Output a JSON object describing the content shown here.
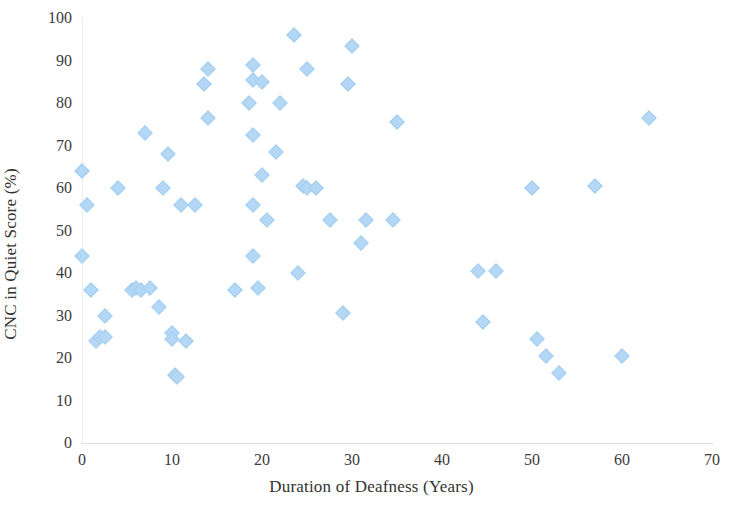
{
  "chart_data": {
    "type": "scatter",
    "title": "",
    "xlabel": "Duration of Deafness (Years)",
    "ylabel": "CNC in Quiet Score (%)",
    "xlim": [
      0,
      70
    ],
    "ylim": [
      0,
      100
    ],
    "xticks": [
      0,
      10,
      20,
      30,
      40,
      50,
      60,
      70
    ],
    "yticks": [
      0,
      10,
      20,
      30,
      40,
      50,
      60,
      70,
      80,
      90,
      100
    ],
    "grid": false,
    "legend": null,
    "marker": "diamond",
    "marker_color": "#b3d7f5",
    "series": [
      {
        "name": "Participants",
        "points": [
          [
            0,
            64
          ],
          [
            0,
            44
          ],
          [
            0.5,
            56
          ],
          [
            1,
            36
          ],
          [
            1.5,
            24
          ],
          [
            2,
            25
          ],
          [
            2.5,
            25
          ],
          [
            2.5,
            30
          ],
          [
            4,
            60
          ],
          [
            5.5,
            36
          ],
          [
            6,
            36.5
          ],
          [
            6.5,
            36
          ],
          [
            7,
            73
          ],
          [
            7.5,
            36.5
          ],
          [
            8.5,
            32
          ],
          [
            9,
            60
          ],
          [
            9.5,
            68
          ],
          [
            10,
            26
          ],
          [
            10,
            24.5
          ],
          [
            10.3,
            16
          ],
          [
            10.5,
            15.5
          ],
          [
            11,
            56
          ],
          [
            11.5,
            24
          ],
          [
            12.5,
            56
          ],
          [
            13.5,
            84.5
          ],
          [
            14,
            88
          ],
          [
            14,
            76.5
          ],
          [
            17,
            36
          ],
          [
            18.5,
            80
          ],
          [
            19,
            89
          ],
          [
            19,
            85.5
          ],
          [
            19,
            72.5
          ],
          [
            19,
            56
          ],
          [
            19,
            44
          ],
          [
            19.5,
            36.5
          ],
          [
            20,
            63
          ],
          [
            20,
            85
          ],
          [
            20.5,
            52.5
          ],
          [
            21.5,
            68.5
          ],
          [
            22,
            80
          ],
          [
            23.5,
            96
          ],
          [
            24,
            40
          ],
          [
            24.5,
            60.5
          ],
          [
            25,
            60
          ],
          [
            25,
            88
          ],
          [
            26,
            60
          ],
          [
            27.5,
            52.5
          ],
          [
            29,
            30.5
          ],
          [
            29.5,
            84.5
          ],
          [
            30,
            93.5
          ],
          [
            31,
            47
          ],
          [
            31.5,
            52.5
          ],
          [
            34.5,
            52.5
          ],
          [
            35,
            75.5
          ],
          [
            44,
            40.5
          ],
          [
            44.5,
            28.5
          ],
          [
            46,
            40.5
          ],
          [
            50,
            60
          ],
          [
            50.5,
            24.5
          ],
          [
            51.5,
            20.5
          ],
          [
            53,
            16.5
          ],
          [
            57,
            60.5
          ],
          [
            60,
            20.5
          ],
          [
            63,
            76.5
          ]
        ]
      }
    ]
  },
  "axis": {
    "x_ticks": [
      "0",
      "10",
      "20",
      "30",
      "40",
      "50",
      "60",
      "70"
    ],
    "y_ticks": [
      "0",
      "10",
      "20",
      "30",
      "40",
      "50",
      "60",
      "70",
      "80",
      "90",
      "100"
    ],
    "x_title": "Duration of Deafness (Years)",
    "y_title": "CNC in Quiet Score (%)"
  }
}
